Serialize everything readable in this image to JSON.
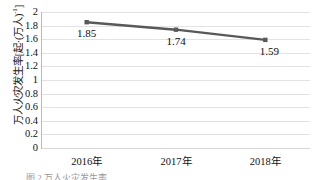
{
  "chart_data": {
    "type": "line",
    "title": "",
    "xlabel": "",
    "ylabel_plain": "万人火灾发生率[起·(万人)⁻¹]",
    "ylabel_main": "万人火灾发生率[起·(万人)",
    "ylabel_sup": "-1",
    "ylabel_tail": "]",
    "categories": [
      "2016年",
      "2017年",
      "2018年"
    ],
    "values": [
      1.85,
      1.74,
      1.59
    ],
    "point_labels": [
      "1.85",
      "1.74",
      "1.59"
    ],
    "ylim": [
      0,
      2
    ],
    "ytick_step": 0.2,
    "yticks": [
      "2",
      "1.8",
      "1.6",
      "1.4",
      "1.2",
      "1",
      "0.8",
      "0.6",
      "0.4",
      "0.2",
      "0"
    ],
    "grid": "horizontal",
    "legend": "none",
    "series": [
      {
        "name": "万人火灾发生率",
        "values": [
          1.85,
          1.74,
          1.59
        ],
        "line_color": "#595959",
        "marker": "square",
        "marker_color": "#595959"
      }
    ],
    "colors": {
      "line": "#595959",
      "gridline": "#e3e3e3",
      "axis": "#b9b9b9",
      "text": "#111111",
      "background": "#ffffff"
    }
  },
  "caption": {
    "fragment": "图 2  万人火灾发生率"
  }
}
